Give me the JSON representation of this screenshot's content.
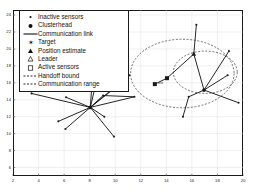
{
  "figure": {
    "kind": "scatter-network-plot",
    "background": "#ffffff",
    "axis_color": "#1a1a1a",
    "grid_color": "#d9d9d9",
    "line_color": "#1a1a1a",
    "marker_color": "#1a1a1a"
  },
  "legend": {
    "position": "top-left",
    "border_color": "#1a1a1a",
    "background": "#ffffff",
    "items": [
      {
        "label": "Inactive sensors",
        "marker": "small-dot-marker"
      },
      {
        "label": "Clusterhead",
        "marker": "filled-circle-marker"
      },
      {
        "label": "Communication link",
        "marker": "solid-line-marker"
      },
      {
        "label": "Target",
        "marker": "star-marker"
      },
      {
        "label": "Position estimate",
        "marker": "filled-triangle-marker"
      },
      {
        "label": "Leader",
        "marker": "open-triangle-marker"
      },
      {
        "label": "Active sensors",
        "marker": "open-square-marker"
      },
      {
        "label": "Handoff bound",
        "marker": "dashed-line-marker"
      },
      {
        "label": "Communication range",
        "marker": "dashed-line-marker"
      }
    ]
  },
  "chart_data": {
    "type": "scatter",
    "title": "",
    "xlabel": "",
    "ylabel": "",
    "xlim": [
      2,
      20
    ],
    "ylim": [
      5,
      24.6
    ],
    "grid": true,
    "xticks": [
      2,
      4,
      6,
      8,
      10,
      12,
      14,
      16,
      18,
      20
    ],
    "yticks": [
      6,
      8,
      10,
      12,
      14,
      16,
      18,
      20,
      22,
      24
    ],
    "xticklabels": [
      "2",
      "4",
      "6",
      "8",
      "10",
      "12",
      "14",
      "16",
      "18",
      "20"
    ],
    "yticklabels": [
      "6",
      "8",
      "10",
      "12",
      "14",
      "16",
      "18",
      "20",
      "22",
      "24"
    ],
    "annotations": [
      {
        "text": "est",
        "x": 13.55,
        "y": 16.0
      }
    ],
    "nodes": [
      {
        "id": "L0",
        "x": 8.05,
        "y": 13.1,
        "type": "clusterhead",
        "marker": "filled-circle-marker"
      },
      {
        "id": "L1",
        "x": 3.45,
        "y": 14.75,
        "type": "inactive-sensor",
        "marker": "small-dot-marker"
      },
      {
        "id": "L2",
        "x": 6.15,
        "y": 14.3,
        "type": "inactive-sensor",
        "marker": "small-dot-marker"
      },
      {
        "id": "L3",
        "x": 9.05,
        "y": 14.5,
        "type": "inactive-sensor",
        "marker": "small-dot-marker"
      },
      {
        "id": "L4",
        "x": 11.5,
        "y": 14.35,
        "type": "inactive-sensor",
        "marker": "small-dot-marker"
      },
      {
        "id": "L5",
        "x": 10.4,
        "y": 15.9,
        "type": "inactive-sensor",
        "marker": "small-dot-marker"
      },
      {
        "id": "L6",
        "x": 11.1,
        "y": 16.9,
        "type": "inactive-sensor",
        "marker": "small-dot-marker"
      },
      {
        "id": "L7",
        "x": 8.9,
        "y": 18.55,
        "type": "inactive-sensor",
        "marker": "small-dot-marker"
      },
      {
        "id": "L8",
        "x": 8.35,
        "y": 19.3,
        "type": "inactive-sensor",
        "marker": "small-dot-marker"
      },
      {
        "id": "L9",
        "x": 5.55,
        "y": 11.45,
        "type": "inactive-sensor",
        "marker": "small-dot-marker"
      },
      {
        "id": "L10",
        "x": 6.1,
        "y": 10.55,
        "type": "inactive-sensor",
        "marker": "small-dot-marker"
      },
      {
        "id": "L11",
        "x": 9.9,
        "y": 9.65,
        "type": "inactive-sensor",
        "marker": "small-dot-marker"
      },
      {
        "id": "L12",
        "x": 9.15,
        "y": 12.0,
        "type": "inactive-sensor",
        "marker": "small-dot-marker"
      },
      {
        "id": "R0",
        "x": 16.95,
        "y": 15.15,
        "type": "clusterhead",
        "marker": "filled-circle-marker"
      },
      {
        "id": "R1",
        "x": 16.15,
        "y": 19.4,
        "type": "position-estimate",
        "marker": "filled-triangle-marker"
      },
      {
        "id": "R2",
        "x": 16.35,
        "y": 22.85,
        "type": "inactive-sensor",
        "marker": "small-dot-marker"
      },
      {
        "id": "R3",
        "x": 14.05,
        "y": 16.55,
        "type": "active-sensor",
        "marker": "filled-square-marker"
      },
      {
        "id": "R4",
        "x": 13.1,
        "y": 15.85,
        "type": "active-sensor",
        "marker": "filled-square-marker"
      },
      {
        "id": "R5",
        "x": 18.9,
        "y": 19.75,
        "type": "inactive-sensor",
        "marker": "small-dot-marker"
      },
      {
        "id": "R6",
        "x": 18.8,
        "y": 16.9,
        "type": "inactive-sensor",
        "marker": "small-dot-marker"
      },
      {
        "id": "R7",
        "x": 19.65,
        "y": 13.65,
        "type": "inactive-sensor",
        "marker": "small-dot-marker"
      },
      {
        "id": "R8",
        "x": 15.75,
        "y": 14.35,
        "type": "inactive-sensor",
        "marker": "small-dot-marker"
      },
      {
        "id": "R9",
        "x": 15.3,
        "y": 12.0,
        "type": "inactive-sensor",
        "marker": "small-dot-marker"
      }
    ],
    "links": [
      [
        "L0",
        "L1"
      ],
      [
        "L0",
        "L2"
      ],
      [
        "L0",
        "L3"
      ],
      [
        "L0",
        "L4"
      ],
      [
        "L0",
        "L5"
      ],
      [
        "L0",
        "L6"
      ],
      [
        "L0",
        "L7"
      ],
      [
        "L0",
        "L8"
      ],
      [
        "L0",
        "L9"
      ],
      [
        "L0",
        "L10"
      ],
      [
        "L0",
        "L11"
      ],
      [
        "L0",
        "L12"
      ],
      [
        "L3",
        "L4"
      ],
      [
        "L5",
        "L6"
      ],
      [
        "R0",
        "R1"
      ],
      [
        "R1",
        "R2"
      ],
      [
        "R1",
        "R3"
      ],
      [
        "R3",
        "R4"
      ],
      [
        "R0",
        "R5"
      ],
      [
        "R0",
        "R6"
      ],
      [
        "R0",
        "R7"
      ],
      [
        "R0",
        "R8"
      ],
      [
        "R8",
        "R9"
      ]
    ],
    "circles": [
      {
        "name": "handoff-bound",
        "cx": 15.25,
        "cy": 17.1,
        "r": 4.05,
        "style": "dashed"
      },
      {
        "name": "communication-range",
        "cx": 17.05,
        "cy": 17.25,
        "r": 2.5,
        "style": "dashed"
      }
    ]
  }
}
